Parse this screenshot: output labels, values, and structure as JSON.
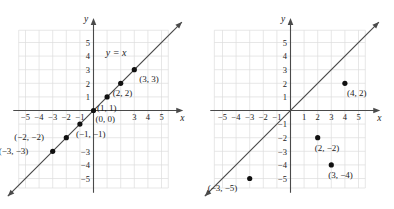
{
  "chart_data": [
    {
      "type": "line",
      "title": "",
      "annotation": "y = x",
      "xlabel": "x",
      "ylabel": "y",
      "xlim": [
        -6,
        6
      ],
      "ylim": [
        -6,
        6
      ],
      "grid": true,
      "x_ticks": [
        "-5",
        "-4",
        "-3",
        "-2",
        "-1",
        "1",
        "2",
        "3",
        "4",
        "5"
      ],
      "x_tick_values": [
        -5,
        -4,
        -3,
        -2,
        -1,
        1,
        2,
        3,
        4,
        5
      ],
      "x_ticks_shown": [
        "-5",
        "-4",
        "-3",
        "-2",
        "-1",
        "3",
        "4",
        "5"
      ],
      "y_ticks": [
        "5",
        "4",
        "3",
        "2",
        "1",
        "-3",
        "-4",
        "-5"
      ],
      "y_tick_values": [
        5,
        4,
        3,
        2,
        1,
        -3,
        -4,
        -5
      ],
      "series": [
        {
          "name": "y = x",
          "kind": "line",
          "x": [
            -6,
            6
          ],
          "y": [
            -6,
            6
          ]
        }
      ],
      "points": [
        {
          "x": 3,
          "y": 3,
          "label": "(3, 3)",
          "label_dx": 5,
          "label_dy": 12
        },
        {
          "x": 2,
          "y": 2,
          "label": "(2, 2)",
          "label_dx": -8,
          "label_dy": 13
        },
        {
          "x": 1,
          "y": 1,
          "label": "(1, 1)",
          "label_dx": -10,
          "label_dy": 14
        },
        {
          "x": 0,
          "y": 0,
          "label": "(0, 0)",
          "label_dx": 2,
          "label_dy": 11
        },
        {
          "x": -1,
          "y": -1,
          "label": "(-1, -1)",
          "label_dx": -4,
          "label_dy": 13
        },
        {
          "x": -2,
          "y": -2,
          "label": "(-2, -2)",
          "label_dx": -52,
          "label_dy": 2
        },
        {
          "x": -3,
          "y": -3,
          "label": "(-3, -3)",
          "label_dx": -54,
          "label_dy": 3
        }
      ]
    },
    {
      "type": "scatter",
      "title": "",
      "annotation": "",
      "xlabel": "x",
      "ylabel": "y",
      "xlim": [
        -6,
        6
      ],
      "ylim": [
        -6,
        6
      ],
      "grid": true,
      "x_ticks": [
        "-5",
        "-4",
        "-3",
        "-2",
        "-1",
        "1",
        "2",
        "3",
        "4",
        "5"
      ],
      "x_tick_values": [
        -5,
        -4,
        -3,
        -2,
        -1,
        1,
        2,
        3,
        4,
        5
      ],
      "x_ticks_shown": [
        "-5",
        "-4",
        "-3",
        "-2",
        "-1",
        "1",
        "2",
        "3",
        "4",
        "5"
      ],
      "y_ticks": [
        "5",
        "4",
        "3",
        "2",
        "1",
        "-1",
        "-2",
        "-3",
        "-4",
        "-5"
      ],
      "y_tick_values": [
        5,
        4,
        3,
        2,
        1,
        -1,
        -2,
        -3,
        -4,
        -5
      ],
      "series": [
        {
          "name": "y = x",
          "kind": "line",
          "x": [
            -6,
            6
          ],
          "y": [
            -6,
            6
          ]
        }
      ],
      "points": [
        {
          "x": 4,
          "y": 2,
          "label": "(4, 2)",
          "label_dx": 2,
          "label_dy": 13
        },
        {
          "x": 2,
          "y": -2,
          "label": "(2, -2)",
          "label_dx": -3,
          "label_dy": 13
        },
        {
          "x": 3,
          "y": -4,
          "label": "(3, -4)",
          "label_dx": -3,
          "label_dy": 13
        },
        {
          "x": -3,
          "y": -5,
          "label": "(-3, -5)",
          "label_dx": -42,
          "label_dy": 12
        }
      ]
    }
  ],
  "figure": {
    "left_panel_name": "graph-of-y-equals-x",
    "right_panel_name": "scatter-plot-points",
    "axis_color": "#4a4a4a",
    "grid_color": "#dcdcdc",
    "point_color": "#111111",
    "background": "#ffffff"
  }
}
